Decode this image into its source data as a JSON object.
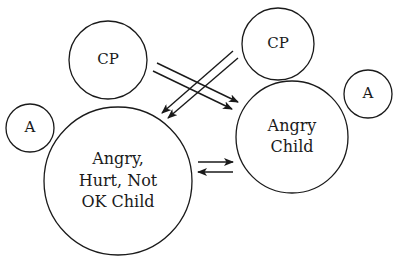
{
  "diagram": {
    "background": "#ffffff",
    "stroke_color": "#1a1a1a",
    "nodes": [
      {
        "id": "cp_left",
        "label_lines": [
          "CP"
        ],
        "cx": 108,
        "cy": 60,
        "r": 39,
        "font_size": 15
      },
      {
        "id": "cp_right",
        "label_lines": [
          "CP"
        ],
        "cx": 278,
        "cy": 44,
        "r": 36,
        "font_size": 15
      },
      {
        "id": "a_left",
        "label_lines": [
          "A"
        ],
        "cx": 30,
        "cy": 128,
        "r": 24,
        "font_size": 15
      },
      {
        "id": "a_right",
        "label_lines": [
          "A"
        ],
        "cx": 368,
        "cy": 94,
        "r": 24,
        "font_size": 15
      },
      {
        "id": "angry_hurt_not_ok_child",
        "label_lines": [
          "Angry,",
          "Hurt, Not",
          "OK Child"
        ],
        "cx": 118,
        "cy": 181,
        "r": 74,
        "font_size": 16
      },
      {
        "id": "angry_child",
        "label_lines": [
          "Angry",
          "Child"
        ],
        "cx": 292,
        "cy": 137,
        "r": 56,
        "font_size": 16
      }
    ],
    "arrows": [
      {
        "id": "cp_left_to_angry_child_1",
        "x1": 157,
        "y1": 63,
        "x2": 238,
        "y2": 102
      },
      {
        "id": "cp_left_to_angry_child_2",
        "x1": 153,
        "y1": 71,
        "x2": 232,
        "y2": 109
      },
      {
        "id": "cp_right_to_hurt_child_1",
        "x1": 233,
        "y1": 51,
        "x2": 162,
        "y2": 113
      },
      {
        "id": "cp_right_to_hurt_child_2",
        "x1": 238,
        "y1": 58,
        "x2": 168,
        "y2": 118
      },
      {
        "id": "hurt_child_to_angry_child",
        "x1": 198,
        "y1": 162,
        "x2": 233,
        "y2": 162
      },
      {
        "id": "angry_child_to_hurt_child",
        "x1": 233,
        "y1": 172,
        "x2": 198,
        "y2": 172
      }
    ]
  }
}
